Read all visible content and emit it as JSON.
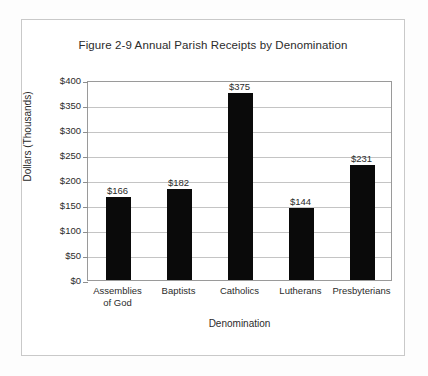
{
  "figure": {
    "title": "Figure 2-9 Annual Parish Receipts by Denomination",
    "border_color": "#c9c9c9",
    "plot_border_color": "#9a9a9a",
    "gridline_color": "#c4c4c4",
    "bar_color": "#0a0a0a",
    "text_color": "#2b2b2b"
  },
  "chart_data": {
    "type": "bar",
    "title": "Figure 2-9 Annual Parish Receipts by Denomination",
    "xlabel": "Denomination",
    "ylabel": "Dollars  (Thousands)",
    "categories": [
      "Assemblies\nof God",
      "Baptists",
      "Catholics",
      "Lutherans",
      "Presbyterians"
    ],
    "values": [
      166,
      182,
      375,
      144,
      231
    ],
    "value_labels": [
      "$166",
      "$182",
      "$375",
      "$144",
      "$231"
    ],
    "ylim": [
      0,
      400
    ],
    "ytick_step": 50,
    "ytick_labels": [
      "$400",
      "$350",
      "$300",
      "$250",
      "$200",
      "$150",
      "$100",
      "$50",
      "$0"
    ],
    "ytick_values": [
      400,
      350,
      300,
      250,
      200,
      150,
      100,
      50,
      0
    ],
    "grid": true,
    "legend": null,
    "legend_position": "none"
  }
}
